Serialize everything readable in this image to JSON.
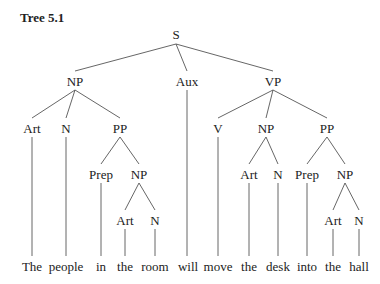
{
  "title": "Tree 5.1",
  "tree": {
    "nodes": [
      {
        "id": "S",
        "label": "S",
        "x": 176,
        "y": 28
      },
      {
        "id": "NP1",
        "label": "NP",
        "x": 75,
        "y": 75
      },
      {
        "id": "Aux",
        "label": "Aux",
        "x": 187,
        "y": 75
      },
      {
        "id": "VP",
        "label": "VP",
        "x": 273,
        "y": 75
      },
      {
        "id": "Art1",
        "label": "Art",
        "x": 32,
        "y": 122
      },
      {
        "id": "N1",
        "label": "N",
        "x": 66,
        "y": 122
      },
      {
        "id": "PP1",
        "label": "PP",
        "x": 120,
        "y": 122
      },
      {
        "id": "V",
        "label": "V",
        "x": 218,
        "y": 122
      },
      {
        "id": "NP3",
        "label": "NP",
        "x": 266,
        "y": 122
      },
      {
        "id": "PP2",
        "label": "PP",
        "x": 327,
        "y": 122
      },
      {
        "id": "Prep1",
        "label": "Prep",
        "x": 101,
        "y": 168
      },
      {
        "id": "NP2",
        "label": "NP",
        "x": 139,
        "y": 168
      },
      {
        "id": "Art3",
        "label": "Art",
        "x": 249,
        "y": 168
      },
      {
        "id": "N3",
        "label": "N",
        "x": 278,
        "y": 168
      },
      {
        "id": "Prep2",
        "label": "Prep",
        "x": 307,
        "y": 168
      },
      {
        "id": "NP4",
        "label": "NP",
        "x": 345,
        "y": 168
      },
      {
        "id": "Art2",
        "label": "Art",
        "x": 125,
        "y": 214
      },
      {
        "id": "N2",
        "label": "N",
        "x": 155,
        "y": 214
      },
      {
        "id": "Art4",
        "label": "Art",
        "x": 333,
        "y": 214
      },
      {
        "id": "N4",
        "label": "N",
        "x": 359,
        "y": 214
      }
    ],
    "words": [
      {
        "text": "The",
        "x": 32
      },
      {
        "text": "people",
        "x": 66
      },
      {
        "text": "in",
        "x": 101
      },
      {
        "text": "the",
        "x": 125
      },
      {
        "text": "room",
        "x": 155
      },
      {
        "text": "will",
        "x": 188
      },
      {
        "text": "move",
        "x": 218
      },
      {
        "text": "the",
        "x": 249
      },
      {
        "text": "desk",
        "x": 278
      },
      {
        "text": "into",
        "x": 307
      },
      {
        "text": "the",
        "x": 333
      },
      {
        "text": "hall",
        "x": 359
      }
    ],
    "words_y": 260
  }
}
